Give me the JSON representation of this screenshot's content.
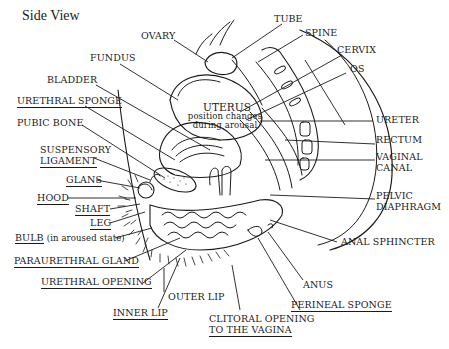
{
  "title": "Side View",
  "colors": {
    "ink": "#1a1a1a",
    "background": "#ffffff"
  },
  "labels": {
    "ovary": "OVARY",
    "tube": "TUBE",
    "spine": "SPINE",
    "cervix": "CERVIX",
    "os": "OS",
    "fundus": "FUNDUS",
    "bladder": "BLADDER",
    "urethral_sponge": "URETHRAL SPONGE",
    "pubic_bone": "PUBIC BONE",
    "suspensory_ligament_1": "SUSPENSORY",
    "suspensory_ligament_2": "LIGAMENT",
    "glans": "GLANS",
    "hood": "HOOD",
    "shaft": "SHAFT",
    "leg": "LEG",
    "bulb": "BULB",
    "bulb_note": "(in aroused state)",
    "paraurethral_gland": "PARAURETHRAL GLAND",
    "urethral_opening": "URETHRAL OPENING",
    "inner_lip": "INNER LIP",
    "outer_lip": "OUTER LIP",
    "clitoral_opening_1": "CLITORAL OPENING",
    "clitoral_opening_2": "TO THE VAGINA",
    "perineal_sponge": "PERINEAL SPONGE",
    "anus": "ANUS",
    "anal_sphincter": "ANAL SPHINCTER",
    "pelvic_diaphragm_1": "PELVIC",
    "pelvic_diaphragm_2": "DIAPHRAGM",
    "vaginal_canal_1": "VAGINAL",
    "vaginal_canal_2": "CANAL",
    "rectum": "RECTUM",
    "ureter": "URETER",
    "uterus": "UTERUS",
    "uterus_note_1": "position changes",
    "uterus_note_2": "during arousal"
  }
}
